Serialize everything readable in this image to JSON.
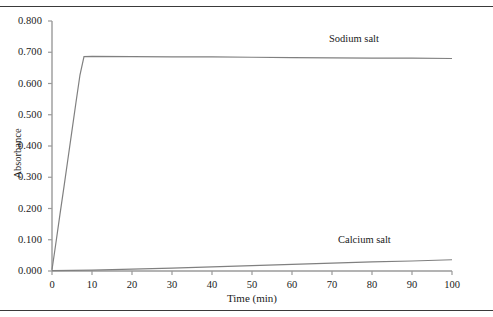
{
  "chart_data": {
    "type": "line",
    "title": "",
    "xlabel": "Time (min)",
    "ylabel": "Absorbance",
    "xlim": [
      0,
      100
    ],
    "ylim": [
      0.0,
      0.8
    ],
    "grid": false,
    "legend_position": "inline-annotation",
    "xticks": [
      "0",
      "10",
      "20",
      "30",
      "40",
      "50",
      "60",
      "70",
      "80",
      "90",
      "100"
    ],
    "xtick_values": [
      0,
      10,
      20,
      30,
      40,
      50,
      60,
      70,
      80,
      90,
      100
    ],
    "yticks": [
      "0.000",
      "0.100",
      "0.200",
      "0.300",
      "0.400",
      "0.500",
      "0.600",
      "0.700",
      "0.800"
    ],
    "ytick_values": [
      0.0,
      0.1,
      0.2,
      0.3,
      0.4,
      0.5,
      0.6,
      0.7,
      0.8
    ],
    "series": [
      {
        "name": "Sodium salt",
        "color": "#808080",
        "x": [
          0,
          1,
          2,
          3,
          4,
          5,
          6,
          7,
          8,
          10,
          20,
          30,
          40,
          50,
          60,
          70,
          80,
          90,
          100
        ],
        "values": [
          0.004,
          0.092,
          0.182,
          0.27,
          0.36,
          0.45,
          0.54,
          0.628,
          0.686,
          0.687,
          0.686,
          0.685,
          0.685,
          0.684,
          0.683,
          0.682,
          0.681,
          0.681,
          0.68
        ]
      },
      {
        "name": "Calcium salt",
        "color": "#808080",
        "x": [
          0,
          5,
          10,
          20,
          30,
          40,
          50,
          60,
          70,
          80,
          90,
          100
        ],
        "values": [
          0.001,
          0.002,
          0.003,
          0.006,
          0.009,
          0.013,
          0.017,
          0.021,
          0.025,
          0.029,
          0.032,
          0.036
        ]
      }
    ],
    "annotations": [
      {
        "text": "Sodium salt",
        "x": 70,
        "y": 0.745
      },
      {
        "text": "Calcium salt",
        "x": 72,
        "y": 0.105
      }
    ]
  }
}
